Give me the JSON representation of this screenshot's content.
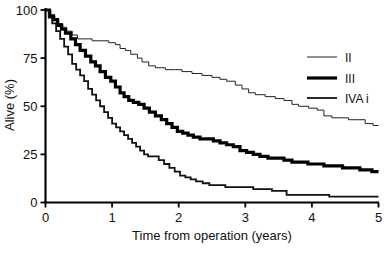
{
  "chart_data": {
    "type": "line",
    "title": "",
    "xlabel": "Time from operation (years)",
    "ylabel": "Alive (%)",
    "xlim": [
      0,
      5
    ],
    "ylim": [
      0,
      100
    ],
    "xticks": [
      "0",
      "1",
      "2",
      "3",
      "4",
      "5"
    ],
    "yticks": [
      "0",
      "25",
      "50",
      "75",
      "100"
    ],
    "grid": false,
    "legend_position": "upper-right",
    "series": [
      {
        "name": "II",
        "style": "thin",
        "stroke_width": 1.0,
        "color": "#222222",
        "points": [
          [
            0.0,
            100
          ],
          [
            0.08,
            97
          ],
          [
            0.14,
            95
          ],
          [
            0.2,
            93
          ],
          [
            0.26,
            91
          ],
          [
            0.32,
            89
          ],
          [
            0.4,
            87
          ],
          [
            0.48,
            85
          ],
          [
            0.56,
            85
          ],
          [
            0.7,
            84
          ],
          [
            0.85,
            84
          ],
          [
            0.95,
            83
          ],
          [
            1.05,
            82
          ],
          [
            1.12,
            80
          ],
          [
            1.2,
            79
          ],
          [
            1.28,
            77
          ],
          [
            1.38,
            75
          ],
          [
            1.45,
            73
          ],
          [
            1.55,
            71
          ],
          [
            1.65,
            70
          ],
          [
            1.8,
            69
          ],
          [
            1.95,
            69
          ],
          [
            2.05,
            68
          ],
          [
            2.2,
            67
          ],
          [
            2.35,
            66
          ],
          [
            2.5,
            65
          ],
          [
            2.62,
            64
          ],
          [
            2.72,
            63
          ],
          [
            2.85,
            61
          ],
          [
            2.95,
            59
          ],
          [
            3.05,
            57
          ],
          [
            3.15,
            56
          ],
          [
            3.3,
            55
          ],
          [
            3.45,
            54
          ],
          [
            3.58,
            53
          ],
          [
            3.7,
            51
          ],
          [
            3.8,
            50
          ],
          [
            3.95,
            49
          ],
          [
            4.08,
            48
          ],
          [
            4.18,
            45
          ],
          [
            4.3,
            44
          ],
          [
            4.45,
            44
          ],
          [
            4.55,
            43
          ],
          [
            4.7,
            43
          ],
          [
            4.8,
            41
          ],
          [
            4.92,
            40
          ],
          [
            5.0,
            40
          ]
        ]
      },
      {
        "name": "III",
        "style": "thick",
        "stroke_width": 3.2,
        "color": "#000000",
        "points": [
          [
            0.0,
            100
          ],
          [
            0.06,
            97
          ],
          [
            0.12,
            95
          ],
          [
            0.18,
            92
          ],
          [
            0.24,
            90
          ],
          [
            0.3,
            88
          ],
          [
            0.38,
            85
          ],
          [
            0.45,
            82
          ],
          [
            0.52,
            79
          ],
          [
            0.6,
            76
          ],
          [
            0.68,
            73
          ],
          [
            0.75,
            71
          ],
          [
            0.82,
            68
          ],
          [
            0.9,
            65
          ],
          [
            0.98,
            63
          ],
          [
            1.05,
            60
          ],
          [
            1.12,
            57
          ],
          [
            1.18,
            55
          ],
          [
            1.25,
            53
          ],
          [
            1.32,
            52
          ],
          [
            1.4,
            51
          ],
          [
            1.48,
            49
          ],
          [
            1.56,
            47
          ],
          [
            1.65,
            45
          ],
          [
            1.74,
            43
          ],
          [
            1.82,
            41
          ],
          [
            1.9,
            39
          ],
          [
            1.98,
            37
          ],
          [
            2.06,
            36
          ],
          [
            2.14,
            35
          ],
          [
            2.22,
            34
          ],
          [
            2.32,
            33
          ],
          [
            2.42,
            33
          ],
          [
            2.52,
            32
          ],
          [
            2.62,
            31
          ],
          [
            2.72,
            30
          ],
          [
            2.82,
            29
          ],
          [
            2.92,
            27
          ],
          [
            3.02,
            26
          ],
          [
            3.12,
            25
          ],
          [
            3.22,
            24
          ],
          [
            3.34,
            23
          ],
          [
            3.46,
            23
          ],
          [
            3.58,
            22
          ],
          [
            3.7,
            21
          ],
          [
            3.82,
            21
          ],
          [
            3.94,
            20
          ],
          [
            4.06,
            20
          ],
          [
            4.18,
            19
          ],
          [
            4.32,
            19
          ],
          [
            4.46,
            18
          ],
          [
            4.6,
            18
          ],
          [
            4.72,
            17
          ],
          [
            4.84,
            17
          ],
          [
            4.9,
            16
          ],
          [
            5.0,
            16
          ]
        ]
      },
      {
        "name": "IVA i",
        "style": "medium",
        "stroke_width": 1.8,
        "color": "#111111",
        "points": [
          [
            0.0,
            100
          ],
          [
            0.05,
            96
          ],
          [
            0.1,
            93
          ],
          [
            0.16,
            89
          ],
          [
            0.22,
            85
          ],
          [
            0.28,
            81
          ],
          [
            0.34,
            77
          ],
          [
            0.4,
            72
          ],
          [
            0.46,
            69
          ],
          [
            0.52,
            66
          ],
          [
            0.58,
            63
          ],
          [
            0.64,
            59
          ],
          [
            0.7,
            56
          ],
          [
            0.76,
            53
          ],
          [
            0.82,
            50
          ],
          [
            0.88,
            47
          ],
          [
            0.94,
            44
          ],
          [
            1.0,
            41
          ],
          [
            1.06,
            39
          ],
          [
            1.12,
            37
          ],
          [
            1.18,
            35
          ],
          [
            1.24,
            33
          ],
          [
            1.3,
            31
          ],
          [
            1.36,
            29
          ],
          [
            1.42,
            27
          ],
          [
            1.48,
            25
          ],
          [
            1.54,
            24
          ],
          [
            1.62,
            24
          ],
          [
            1.7,
            22
          ],
          [
            1.78,
            20
          ],
          [
            1.86,
            18
          ],
          [
            1.94,
            16
          ],
          [
            2.02,
            14
          ],
          [
            2.1,
            13
          ],
          [
            2.18,
            12
          ],
          [
            2.26,
            11
          ],
          [
            2.36,
            10
          ],
          [
            2.46,
            9
          ],
          [
            2.58,
            9
          ],
          [
            2.7,
            8
          ],
          [
            2.84,
            8
          ],
          [
            2.98,
            8
          ],
          [
            3.12,
            7
          ],
          [
            3.26,
            7
          ],
          [
            3.4,
            6
          ],
          [
            3.52,
            6
          ],
          [
            3.62,
            4
          ],
          [
            3.78,
            4
          ],
          [
            3.95,
            4
          ],
          [
            4.12,
            4
          ],
          [
            4.26,
            3
          ],
          [
            4.45,
            3
          ],
          [
            4.65,
            3
          ],
          [
            4.85,
            3
          ],
          [
            5.0,
            3
          ]
        ]
      }
    ],
    "legend": [
      {
        "label": "II",
        "style": "thin"
      },
      {
        "label": "III",
        "style": "thick"
      },
      {
        "label": "IVA i",
        "style": "medium"
      }
    ]
  }
}
